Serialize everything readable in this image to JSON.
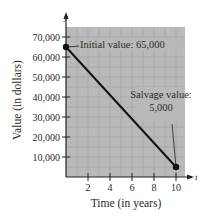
{
  "chart_data": {
    "type": "line",
    "title": "",
    "xlabel": "Time (in years)",
    "ylabel": "Value (in dollars)",
    "x_axis_var": "t",
    "y_axis_var": "y",
    "xlim": [
      0,
      11
    ],
    "ylim": [
      0,
      75000
    ],
    "x_ticks": [
      2,
      4,
      6,
      8,
      10
    ],
    "x_tick_labels": [
      "2",
      "4",
      "6",
      "8",
      "10"
    ],
    "y_ticks": [
      10000,
      20000,
      30000,
      40000,
      50000,
      60000,
      70000
    ],
    "y_tick_labels": [
      "10,000",
      "20,000",
      "30,000",
      "40,000",
      "50,000",
      "60,000",
      "70,000"
    ],
    "grid": true,
    "series": [
      {
        "name": "Value",
        "x": [
          0,
          10
        ],
        "y": [
          65000,
          5000
        ]
      }
    ],
    "annotations": [
      {
        "text": "Initial value: 65,000",
        "x": 0,
        "y": 65000
      },
      {
        "text_line1": "Salvage value:",
        "text_line2": "5,000",
        "x": 10,
        "y": 5000
      }
    ]
  },
  "colors": {
    "plot_bg": "#b9b9b9",
    "grid": "#a3a3a3",
    "line": "#111111",
    "text": "#2a2a2a"
  }
}
